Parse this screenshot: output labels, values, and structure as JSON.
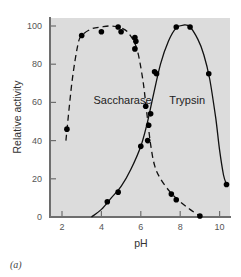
{
  "chart_data": {
    "type": "line",
    "title": "",
    "xlabel": "pH",
    "ylabel": "Relative activity",
    "xlim": [
      1.6,
      10.6
    ],
    "ylim": [
      0,
      105
    ],
    "x_ticks": [
      2,
      4,
      6,
      8,
      10
    ],
    "y_ticks": [
      0,
      20,
      40,
      60,
      80,
      100
    ],
    "grid": false,
    "background": "#dcdcdc",
    "panel_label": "(a)",
    "series": [
      {
        "name": "Saccharase",
        "line_style": "dashed",
        "color": "#111111",
        "points": [
          {
            "x": 2.25,
            "y": 46
          },
          {
            "x": 3.0,
            "y": 95
          },
          {
            "x": 4.0,
            "y": 97
          },
          {
            "x": 4.85,
            "y": 99.5
          },
          {
            "x": 5.0,
            "y": 97
          },
          {
            "x": 5.7,
            "y": 94
          },
          {
            "x": 5.75,
            "y": 92
          },
          {
            "x": 5.7,
            "y": 88
          },
          {
            "x": 6.25,
            "y": 58
          },
          {
            "x": 6.4,
            "y": 48
          },
          {
            "x": 6.35,
            "y": 40
          },
          {
            "x": 7.55,
            "y": 12
          },
          {
            "x": 7.8,
            "y": 9
          },
          {
            "x": 9.0,
            "y": 0.5
          }
        ],
        "curve": [
          [
            2.2,
            40
          ],
          [
            2.5,
            70
          ],
          [
            2.8,
            90
          ],
          [
            3.0,
            95
          ],
          [
            3.5,
            98.5
          ],
          [
            4.0,
            99.5
          ],
          [
            4.5,
            100
          ],
          [
            5.0,
            99
          ],
          [
            5.4,
            96
          ],
          [
            5.8,
            88
          ],
          [
            6.1,
            72
          ],
          [
            6.3,
            55
          ],
          [
            6.5,
            38
          ],
          [
            6.7,
            27
          ],
          [
            7.0,
            20
          ],
          [
            7.5,
            13
          ],
          [
            8.0,
            8
          ],
          [
            8.5,
            4
          ],
          [
            9.0,
            0.5
          ]
        ],
        "label_position": {
          "x": 3.6,
          "y": 59
        }
      },
      {
        "name": "Trypsin",
        "line_style": "solid",
        "color": "#111111",
        "points": [
          {
            "x": 4.3,
            "y": 8
          },
          {
            "x": 4.85,
            "y": 13
          },
          {
            "x": 6.0,
            "y": 37
          },
          {
            "x": 6.5,
            "y": 54
          },
          {
            "x": 6.7,
            "y": 76
          },
          {
            "x": 6.8,
            "y": 75
          },
          {
            "x": 7.8,
            "y": 99.5
          },
          {
            "x": 8.5,
            "y": 99.5
          },
          {
            "x": 9.45,
            "y": 75
          },
          {
            "x": 10.35,
            "y": 17
          }
        ],
        "curve": [
          [
            3.5,
            0
          ],
          [
            4.0,
            4
          ],
          [
            4.5,
            10
          ],
          [
            5.0,
            16
          ],
          [
            5.5,
            25
          ],
          [
            6.0,
            37
          ],
          [
            6.3,
            48
          ],
          [
            6.6,
            62
          ],
          [
            7.0,
            80
          ],
          [
            7.4,
            92
          ],
          [
            7.8,
            99
          ],
          [
            8.2,
            100.5
          ],
          [
            8.5,
            99.5
          ],
          [
            8.9,
            93
          ],
          [
            9.2,
            85
          ],
          [
            9.5,
            72
          ],
          [
            9.8,
            52
          ],
          [
            10.0,
            35
          ],
          [
            10.2,
            22
          ],
          [
            10.35,
            17
          ]
        ],
        "label_position": {
          "x": 7.45,
          "y": 59
        }
      }
    ]
  }
}
